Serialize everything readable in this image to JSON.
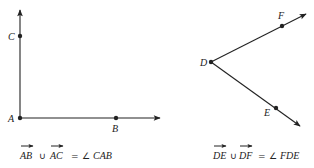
{
  "figure_left": {
    "points": {
      "A": {
        "label": "A",
        "x": 20,
        "y": 118
      },
      "B": {
        "label": "B",
        "x": 116,
        "y": 118
      },
      "C": {
        "label": "C",
        "x": 20,
        "y": 36
      }
    },
    "rays": [
      {
        "from": "A",
        "through": "B",
        "tip": [
          160,
          118
        ]
      },
      {
        "from": "A",
        "through": "C",
        "tip": [
          20,
          10
        ]
      }
    ],
    "equation": {
      "ray1": "AB",
      "union": "∪",
      "ray2": "AC",
      "equals": "=",
      "angle_symbol": "∠",
      "angle": "CAB"
    }
  },
  "figure_right": {
    "points": {
      "D": {
        "label": "D",
        "x": 211,
        "y": 62
      },
      "E": {
        "label": "E",
        "x": 276,
        "y": 108
      },
      "F": {
        "label": "F",
        "x": 282,
        "y": 26
      }
    },
    "rays": [
      {
        "from": "D",
        "through": "F",
        "tip": [
          306,
          14
        ]
      },
      {
        "from": "D",
        "through": "E",
        "tip": [
          300,
          126
        ]
      }
    ],
    "equation": {
      "ray1": "DE",
      "union": "∪",
      "ray2": "DF",
      "equals": "=",
      "angle_symbol": "∠",
      "angle": "FDE"
    }
  },
  "colors": {
    "ink": "#222222",
    "background": "#ffffff"
  }
}
